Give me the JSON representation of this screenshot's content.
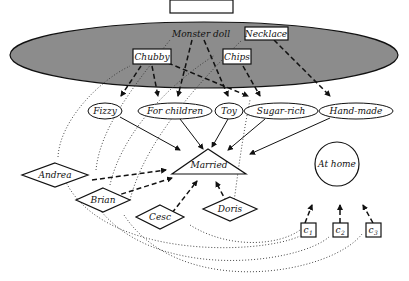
{
  "diagram": {
    "colors": {
      "ellipse_fill": "#8c8c8c",
      "stroke": "#111111",
      "background": "#ffffff"
    },
    "group": {
      "label": ""
    },
    "boxes": [
      {
        "id": "monster-doll",
        "label": "Monster doll"
      },
      {
        "id": "necklace",
        "label": "Necklace"
      },
      {
        "id": "chubby",
        "label": "Chubby"
      },
      {
        "id": "chips",
        "label": "Chips"
      }
    ],
    "attributes": [
      {
        "id": "fizzy",
        "label": "Fizzy"
      },
      {
        "id": "for-children",
        "label": "For children"
      },
      {
        "id": "toy",
        "label": "Toy"
      },
      {
        "id": "sugar-rich",
        "label": "Sugar-rich"
      },
      {
        "id": "hand-made",
        "label": "Hand-made"
      }
    ],
    "married": {
      "label": "Married"
    },
    "people": [
      {
        "id": "andrea",
        "label": "Andrea"
      },
      {
        "id": "brian",
        "label": "Brian"
      },
      {
        "id": "cesc",
        "label": "Cesc"
      },
      {
        "id": "doris",
        "label": "Doris"
      }
    ],
    "at_home": {
      "label": "At home"
    },
    "contexts": [
      {
        "id": "c1",
        "label": "c",
        "sub": "1"
      },
      {
        "id": "c2",
        "label": "c",
        "sub": "2"
      },
      {
        "id": "c3",
        "label": "c",
        "sub": "3"
      }
    ]
  }
}
